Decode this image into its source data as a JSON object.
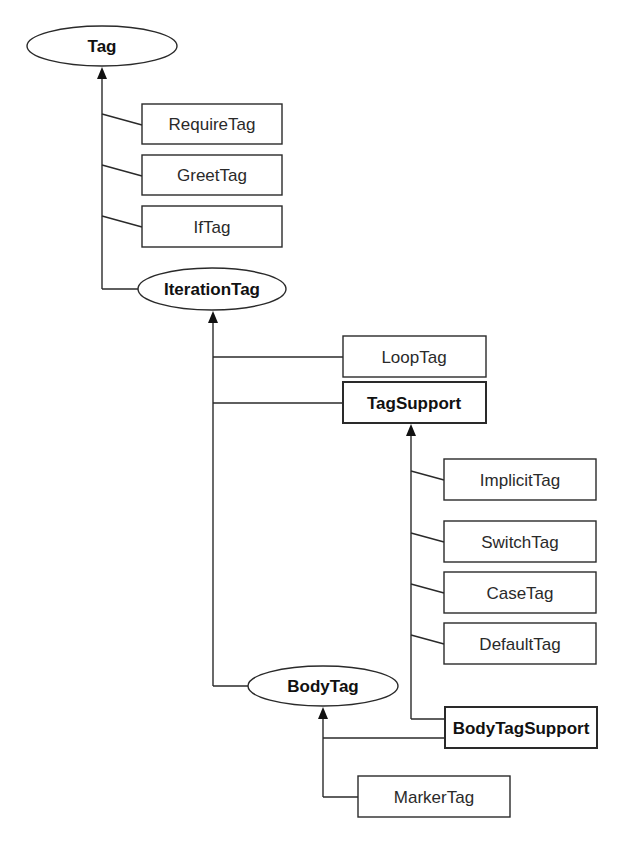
{
  "diagram": {
    "type": "class-hierarchy",
    "colors": {
      "line": "#2a2a2a",
      "background": "#ffffff",
      "text": "#2a2a2a"
    },
    "interfaces": {
      "tag": "Tag",
      "iteration_tag": "IterationTag",
      "body_tag": "BodyTag"
    },
    "classes": {
      "require_tag": "RequireTag",
      "greet_tag": "GreetTag",
      "if_tag": "IfTag",
      "loop_tag": "LoopTag",
      "tag_support": "TagSupport",
      "implicit_tag": "ImplicitTag",
      "switch_tag": "SwitchTag",
      "case_tag": "CaseTag",
      "default_tag": "DefaultTag",
      "body_tag_support": "BodyTagSupport",
      "marker_tag": "MarkerTag"
    },
    "relationships": [
      {
        "from": "RequireTag",
        "to": "Tag"
      },
      {
        "from": "GreetTag",
        "to": "Tag"
      },
      {
        "from": "IfTag",
        "to": "Tag"
      },
      {
        "from": "IterationTag",
        "to": "Tag"
      },
      {
        "from": "LoopTag",
        "to": "IterationTag"
      },
      {
        "from": "TagSupport",
        "to": "IterationTag"
      },
      {
        "from": "BodyTag",
        "to": "IterationTag"
      },
      {
        "from": "ImplicitTag",
        "to": "TagSupport"
      },
      {
        "from": "SwitchTag",
        "to": "TagSupport"
      },
      {
        "from": "CaseTag",
        "to": "TagSupport"
      },
      {
        "from": "DefaultTag",
        "to": "TagSupport"
      },
      {
        "from": "BodyTagSupport",
        "to": "TagSupport"
      },
      {
        "from": "BodyTagSupport",
        "to": "BodyTag"
      },
      {
        "from": "MarkerTag",
        "to": "BodyTag"
      }
    ]
  }
}
